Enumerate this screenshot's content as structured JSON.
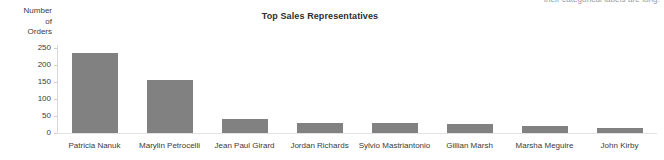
{
  "note": {
    "text": "their categorical labels are long."
  },
  "chart_data": {
    "type": "bar",
    "title": "Top Sales Representatives",
    "xlabel": "",
    "ylabel": "Number of Orders",
    "ylabel_lines": [
      "Number",
      "of",
      "Orders"
    ],
    "categories": [
      "Patricia Nanuk",
      "Marylin Petrocelli",
      "Jean Paul Girard",
      "Jordan Richards",
      "Sylvio Mastriantonio",
      "Gillian Marsh",
      "Marsha Meguire",
      "John Kirby"
    ],
    "values": [
      235,
      156,
      41,
      29,
      29,
      27,
      22,
      15
    ],
    "ylim": [
      0,
      250
    ],
    "yticks": [
      0,
      50,
      100,
      150,
      200,
      250
    ],
    "ytick_labels": [
      "0",
      "50",
      "100",
      "150",
      "200",
      "250"
    ],
    "grid": false,
    "legend": false,
    "bar_color": "#818181",
    "axis_color": "#d8d8d8",
    "text_color": "#3a3a3a"
  }
}
